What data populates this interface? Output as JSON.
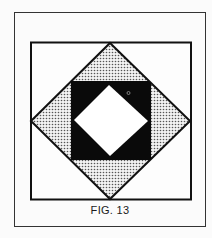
{
  "figure": {
    "caption": "FIG. 13",
    "colors": {
      "background": "#fbfbfb",
      "line": "#111111",
      "fill_dark": "#0a0a0a",
      "stipple": "#555555",
      "light": "#ffffff"
    },
    "shapes": {
      "outer_frame": "rectangle",
      "inner_square": "square",
      "stippled_diamond": "diamond",
      "black_square": "square",
      "white_diamond": "diamond",
      "small_circle": "circle"
    }
  }
}
